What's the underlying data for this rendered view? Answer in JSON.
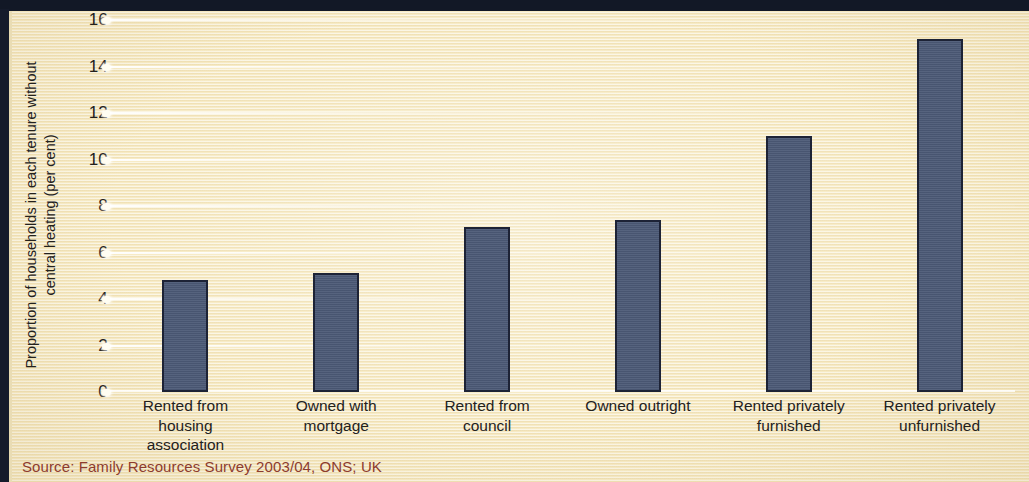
{
  "figure": {
    "background_color": "#f7ebc6",
    "bar_color": "#4c5a77",
    "bar_outline_color": "#1d2336",
    "text_color": "#23211d",
    "source_color": "#8d3c2e",
    "band_color": "#121826"
  },
  "source_note": "Source: Family Resources Survey 2003/04, ONS; UK",
  "chart_data": {
    "type": "bar",
    "title": "",
    "subtitle": "",
    "xlabel": "",
    "ylabel": "Proportion of households in each tenure without central heating (per cent)",
    "categories": [
      "Rented from housing association",
      "Owned with mortgage",
      "Rented from council",
      "Owned outright",
      "Rented privately furnished",
      "Rented privately unfurnished"
    ],
    "category_lines": [
      [
        "Rented from",
        "housing",
        "association"
      ],
      [
        "Owned with",
        "mortgage"
      ],
      [
        "Rented from",
        "council"
      ],
      [
        "Owned outright"
      ],
      [
        "Rented privately",
        "furnished"
      ],
      [
        "Rented privately",
        "unfurnished"
      ]
    ],
    "values": [
      4.8,
      5.1,
      7.1,
      7.4,
      11.0,
      15.2
    ],
    "ylim": [
      0,
      16
    ],
    "yticks": [
      0,
      2,
      4,
      6,
      8,
      10,
      12,
      14,
      16
    ],
    "ytick_labels": [
      "0",
      "2",
      "4",
      "6",
      "8",
      "10",
      "12",
      "14",
      "16"
    ],
    "grid": true,
    "grid_axis": "y",
    "legend": false,
    "legend_position": "none"
  }
}
